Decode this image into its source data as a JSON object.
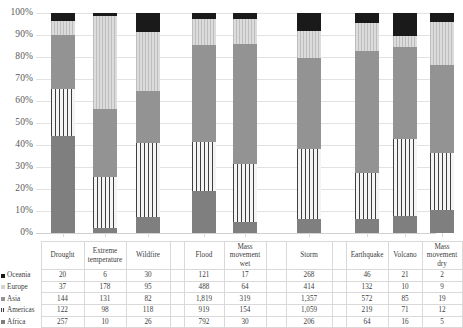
{
  "chart_data": {
    "type": "bar",
    "subtype": "100% stacked column",
    "title": "",
    "xlabel": "",
    "ylabel": "",
    "ylim": [
      0,
      100
    ],
    "yticks": [
      "0%",
      "10%",
      "20%",
      "30%",
      "40%",
      "50%",
      "60%",
      "70%",
      "80%",
      "90%",
      "100%"
    ],
    "grid": true,
    "legend_position": "table-row-labels",
    "categories": [
      "Drought",
      "Extreme temperature",
      "Wildfire",
      "Flood",
      "Mass movement wet",
      "Storm",
      "Earthquake",
      "Volcano",
      "Mass movement dry"
    ],
    "series": [
      {
        "name": "Oceania",
        "values": [
          20,
          6,
          30,
          121,
          17,
          268,
          46,
          21,
          2
        ]
      },
      {
        "name": "Europe",
        "values": [
          37,
          178,
          95,
          488,
          64,
          414,
          132,
          10,
          9
        ]
      },
      {
        "name": "Asia",
        "values": [
          144,
          131,
          82,
          1819,
          319,
          1357,
          572,
          85,
          19
        ]
      },
      {
        "name": "Americas",
        "values": [
          122,
          98,
          118,
          919,
          154,
          1059,
          219,
          71,
          12
        ]
      },
      {
        "name": "Africa",
        "values": [
          257,
          10,
          26,
          792,
          30,
          206,
          64,
          16,
          5
        ]
      }
    ],
    "stack_order_bottom_to_top": [
      "Africa",
      "Americas",
      "Asia",
      "Europe",
      "Oceania"
    ],
    "series_colors": {
      "Oceania": "#1a1a1a",
      "Europe": "#d2d2d2",
      "Asia": "#939393",
      "Americas": "#f2f2f2",
      "Africa": "#7f7f7f"
    }
  },
  "table": {
    "row_labels": [
      "Oceania",
      "Europe",
      "Asia",
      "Americas",
      "Africa"
    ],
    "headers": [
      "Drought",
      "Extreme temperature",
      "Wildfire",
      "Flood",
      "Mass movement wet",
      "Storm",
      "Earthquake",
      "Volcano",
      "Mass movement dry"
    ],
    "rows": [
      {
        "label": "Oceania",
        "cells": [
          "20",
          "6",
          "30",
          "121",
          "17",
          "268",
          "46",
          "21",
          "2"
        ]
      },
      {
        "label": "Europe",
        "cells": [
          "37",
          "178",
          "95",
          "488",
          "64",
          "414",
          "132",
          "10",
          "9"
        ]
      },
      {
        "label": "Asia",
        "cells": [
          "144",
          "131",
          "82",
          "1,819",
          "319",
          "1,357",
          "572",
          "85",
          "19"
        ]
      },
      {
        "label": "Americas",
        "cells": [
          "122",
          "98",
          "118",
          "919",
          "154",
          "1,059",
          "219",
          "71",
          "12"
        ]
      },
      {
        "label": "Africa",
        "cells": [
          "257",
          "10",
          "26",
          "792",
          "30",
          "206",
          "64",
          "16",
          "5"
        ]
      }
    ]
  }
}
